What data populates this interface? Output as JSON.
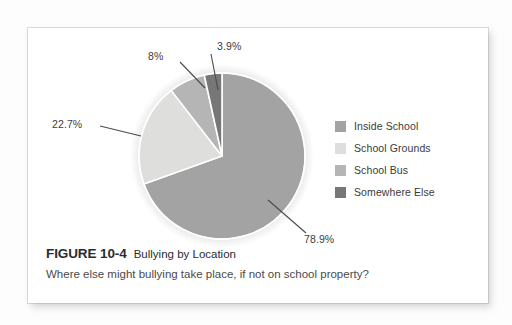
{
  "figure": {
    "number": "FIGURE 10-4",
    "title": "Bullying by Location",
    "subtitle": "Where else might bullying take place, if not on school property?"
  },
  "legend": {
    "items": [
      {
        "label": "Inside School",
        "color": "#a3a3a3"
      },
      {
        "label": "School Grounds",
        "color": "#dededc"
      },
      {
        "label": "School Bus",
        "color": "#b5b5b5"
      },
      {
        "label": "Somewhere Else",
        "color": "#777777"
      }
    ]
  },
  "callouts": {
    "inside_school": "78.9%",
    "school_grounds": "22.7%",
    "school_bus": "8%",
    "somewhere_else": "3.9%"
  },
  "chart_data": {
    "type": "pie",
    "title": "Bullying by Location",
    "subtitle": "Where else might bullying take place, if not on school property?",
    "categories": [
      "Inside School",
      "School Grounds",
      "School Bus",
      "Somewhere Else"
    ],
    "values": [
      78.9,
      22.7,
      8,
      3.9
    ],
    "value_labels": [
      "78.9%",
      "22.7%",
      "8%",
      "3.9%"
    ],
    "colors": [
      "#a3a3a3",
      "#dededc",
      "#b5b5b5",
      "#777777"
    ],
    "start_angle_deg": 0,
    "direction": "clockwise",
    "legend_position": "right",
    "grid": false,
    "labels_outside_with_leader_lines": true
  }
}
